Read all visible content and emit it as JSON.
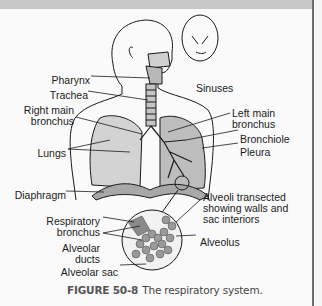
{
  "figure": {
    "number": "FIGURE 50-8",
    "caption": "The respiratory system."
  },
  "labels": {
    "pharynx": "Pharynx",
    "trachea": "Trachea",
    "right_main_bronchus_1": "Right main",
    "right_main_bronchus_2": "bronchus",
    "lungs": "Lungs",
    "diaphragm": "Diaphragm",
    "respiratory_bronchus_1": "Respiratory",
    "respiratory_bronchus_2": "bronchus",
    "alveolar_ducts_1": "Alveolar",
    "alveolar_ducts_2": "ducts",
    "alveolar_sac": "Alveolar sac",
    "sinuses": "Sinuses",
    "left_main_bronchus_1": "Left main",
    "left_main_bronchus_2": "bronchus",
    "bronchiole": "Bronchiole",
    "pleura": "Pleura",
    "alveoli_transected_1": "Alveoli transected",
    "alveoli_transected_2": "showing walls and",
    "alveoli_transected_3": "sac interiors",
    "alveolus": "Alveolus"
  },
  "colors": {
    "line": "#1a1a1a",
    "tissue": "#b5b5b5",
    "light_tissue": "#d8d8d8",
    "alveoli": "#9a9a9a"
  }
}
